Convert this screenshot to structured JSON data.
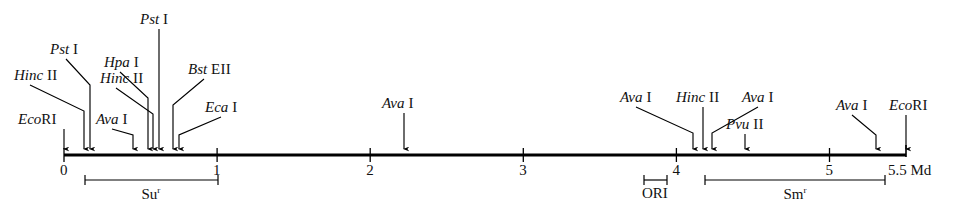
{
  "figure": {
    "type": "restriction-map",
    "axis": {
      "unit_label": "Md",
      "start_value": 0,
      "end_value": 5.5,
      "x_start_px": 64,
      "x_end_px": 906,
      "y_px": 155,
      "px_per_unit": 153.1,
      "tick_labels": [
        "0",
        "1",
        "2",
        "3",
        "4",
        "5"
      ],
      "tick_values": [
        0,
        1,
        2,
        3,
        4,
        5
      ],
      "end_label": "5.5 Md"
    },
    "sites": [
      {
        "enzyme": "Eco",
        "numeral": "RI",
        "position": 0.0,
        "x_px": 64,
        "label_x": 18,
        "label_y": 112,
        "elbow": false
      },
      {
        "enzyme": "Hinc",
        "numeral": "II",
        "position": 0.13,
        "x_px": 84,
        "label_x": 14,
        "label_y": 68,
        "elbow": true
      },
      {
        "enzyme": "Pst",
        "numeral": "I",
        "position": 0.17,
        "x_px": 90,
        "label_x": 50,
        "label_y": 42,
        "elbow": true
      },
      {
        "enzyme": "Ava",
        "numeral": "I",
        "position": 0.45,
        "x_px": 133,
        "label_x": 96,
        "label_y": 112,
        "elbow": true
      },
      {
        "enzyme": "Hpa",
        "numeral": "I",
        "position": 0.55,
        "x_px": 148,
        "label_x": 104,
        "label_y": 55,
        "elbow": true
      },
      {
        "enzyme": "Hinc",
        "numeral": "II",
        "position": 0.58,
        "x_px": 153,
        "label_x": 100,
        "label_y": 71,
        "elbow": true
      },
      {
        "enzyme": "Pst",
        "numeral": "I",
        "position": 0.62,
        "x_px": 159,
        "label_x": 140,
        "label_y": 12,
        "elbow": false
      },
      {
        "enzyme": "Bst",
        "numeral": "EII",
        "position": 0.71,
        "x_px": 173,
        "label_x": 188,
        "label_y": 62,
        "elbow": true
      },
      {
        "enzyme": "Eca",
        "numeral": "I",
        "position": 0.75,
        "x_px": 179,
        "label_x": 205,
        "label_y": 100,
        "elbow": true
      },
      {
        "enzyme": "Ava",
        "numeral": "I",
        "position": 2.22,
        "x_px": 404,
        "label_x": 382,
        "label_y": 96,
        "elbow": false
      },
      {
        "enzyme": "Ava",
        "numeral": "I",
        "position": 4.11,
        "x_px": 693,
        "label_x": 620,
        "label_y": 90,
        "elbow": true
      },
      {
        "enzyme": "Hinc",
        "numeral": "II",
        "position": 4.17,
        "x_px": 703,
        "label_x": 676,
        "label_y": 90,
        "elbow": false
      },
      {
        "enzyme": "Ava",
        "numeral": "I",
        "position": 4.23,
        "x_px": 712,
        "label_x": 742,
        "label_y": 90,
        "elbow": true
      },
      {
        "enzyme": "Pvu",
        "numeral": "II",
        "position": 4.45,
        "x_px": 745,
        "label_x": 726,
        "label_y": 117,
        "elbow": false
      },
      {
        "enzyme": "Ava",
        "numeral": "I",
        "position": 5.3,
        "x_px": 876,
        "label_x": 836,
        "label_y": 98,
        "elbow": true
      },
      {
        "enzyme": "Eco",
        "numeral": "RI",
        "position": 5.5,
        "x_px": 906,
        "label_x": 889,
        "label_y": 98,
        "elbow": false
      }
    ],
    "regions": [
      {
        "name": "Su",
        "superscript": "r",
        "x_start_px": 85,
        "x_end_px": 218,
        "label_x_px": 151,
        "y_px": 180
      },
      {
        "name": "ORI",
        "superscript": "",
        "x_start_px": 644,
        "x_end_px": 667,
        "label_x_px": 655,
        "y_px": 180
      },
      {
        "name": "Sm",
        "superscript": "r",
        "x_start_px": 705,
        "x_end_px": 885,
        "label_x_px": 795,
        "y_px": 180
      }
    ]
  }
}
